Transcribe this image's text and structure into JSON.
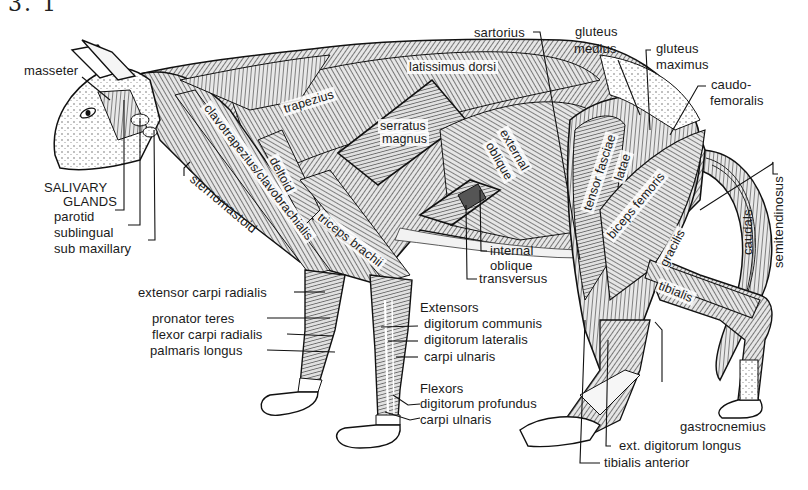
{
  "figure": {
    "number_fragment": "3. 1"
  },
  "colors": {
    "ink": "#1a1a1a",
    "paper": "#ffffff",
    "muscle_fill": "#9a9a9a",
    "muscle_light": "#d4d4d4"
  },
  "labels": {
    "head": {
      "masseter": "masseter",
      "salivary_glands_1": "SALIVARY",
      "salivary_glands_2": "GLANDS",
      "parotid": "parotid",
      "sublingual": "sublingual",
      "sub_maxillary": "sub maxillary"
    },
    "neck_shoulder": {
      "clavotrapezius": "clavotrapezius/clavobrachialis",
      "sternomastoid": "sternomastoid",
      "trapezius": "trapezius",
      "deltoid": "deltoid",
      "triceps": "triceps brachii"
    },
    "trunk": {
      "latissimus": "latissimus dorsi",
      "serratus_1": "serratus",
      "serratus_2": "magnus",
      "ext_oblique_1": "external",
      "ext_oblique_2": "oblique",
      "int_oblique_1": "internal",
      "int_oblique_2": "oblique",
      "transversus": "transversus"
    },
    "hip_leg": {
      "sartorius": "sartorius",
      "gluteus_medius_1": "gluteus",
      "gluteus_medius_2": "medius",
      "gluteus_maximus_1": "gluteus",
      "gluteus_maximus_2": "maximus",
      "caudofemoralis_1": "caudo-",
      "caudofemoralis_2": "femoralis",
      "tensor": "tensor fasciae",
      "latae": "latae",
      "biceps_femoris": "biceps femoris",
      "gracilis": "gracilis",
      "tibialis": "tibialis",
      "caudals": "caudals",
      "semitendinosus": "semitendinosus",
      "gastrocnemius": "gastrocnemius",
      "ext_digitorum_longus": "ext. digitorum longus",
      "tibialis_anterior": "tibialis anterior"
    },
    "forelimb": {
      "extensor_carpi_radialis": "extensor carpi radialis",
      "pronator_teres": "pronator  teres",
      "flexor_carpi_radialis": "flexor carpi radialis",
      "palmaris_longus": "palmaris  longus",
      "extensors_heading": "Extensors",
      "digitorum_communis": "digitorum communis",
      "digitorum_lateralis": "digitorum  lateralis",
      "carpi_ulnaris_ext": "carpi  ulnaris",
      "flexors_heading": "Flexors",
      "digitorum_profundus": "digitorum profundus",
      "carpi_ulnaris_flex": "carpi ulnaris"
    }
  }
}
